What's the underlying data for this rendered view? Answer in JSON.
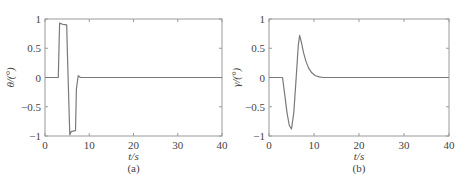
{
  "chart_data": [
    {
      "type": "line",
      "panel_label": "(a)",
      "xlabel": "t/s",
      "ylabel": "θ/(°)",
      "xlim": [
        0,
        40
      ],
      "ylim": [
        -1,
        1
      ],
      "xticks": [
        "0",
        "10",
        "20",
        "30",
        "40"
      ],
      "yticks": [
        "-1",
        "-0.5",
        "0",
        "0.5",
        "1"
      ],
      "grid": false,
      "series": [
        {
          "name": "theta",
          "x": [
            0,
            3.0,
            3.3,
            4.0,
            4.9,
            5.1,
            5.6,
            6.0,
            6.9,
            7.1,
            7.5,
            8.0,
            40
          ],
          "y": [
            0,
            0,
            0.93,
            0.91,
            0.9,
            0.3,
            -0.98,
            -0.92,
            -0.91,
            -0.2,
            0.03,
            0,
            0
          ]
        }
      ]
    },
    {
      "type": "line",
      "panel_label": "(b)",
      "xlabel": "t/s",
      "ylabel": "γ/(°)",
      "xlim": [
        0,
        40
      ],
      "ylim": [
        -1,
        1
      ],
      "xticks": [
        "0",
        "10",
        "20",
        "30",
        "40"
      ],
      "yticks": [
        "-1",
        "-0.5",
        "0",
        "0.5",
        "1"
      ],
      "grid": false,
      "series": [
        {
          "name": "gamma",
          "x": [
            0,
            3.0,
            3.5,
            4.0,
            4.5,
            5.0,
            5.5,
            6.0,
            6.5,
            6.8,
            7.2,
            7.7,
            8.2,
            8.8,
            9.5,
            10.3,
            11.2,
            12.0,
            40
          ],
          "y": [
            0,
            0,
            -0.3,
            -0.6,
            -0.82,
            -0.88,
            -0.6,
            -0.05,
            0.55,
            0.72,
            0.6,
            0.42,
            0.28,
            0.16,
            0.08,
            0.03,
            0.01,
            0,
            0
          ]
        }
      ]
    }
  ],
  "panels": {
    "a": {
      "ylabel": "θ/(°)",
      "xlabel": "t/s",
      "caption": "(a)"
    },
    "b": {
      "ylabel": "γ/(°)",
      "xlabel": "t/s",
      "caption": "(b)"
    }
  }
}
